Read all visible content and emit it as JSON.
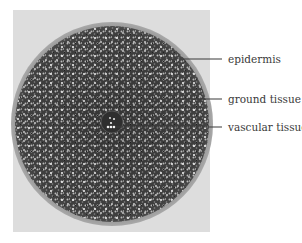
{
  "figure": {
    "colors": {
      "photo_background": "#dcdcdc",
      "tissue_dark": "#3c3c3c",
      "tissue_light": "#e8e8e8",
      "label": "#3a3a3a"
    },
    "labels": [
      {
        "id": "epidermis",
        "text": "epidermis"
      },
      {
        "id": "ground-tissue",
        "text": "ground tissue"
      },
      {
        "id": "vascular-tissue",
        "text": "vascular tissue"
      }
    ]
  }
}
